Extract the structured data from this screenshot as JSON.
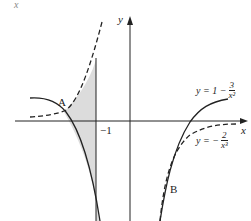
{
  "figure": {
    "corner_label": "x",
    "axes": {
      "x_label": "x",
      "y_label": "y",
      "tick_label": "−1"
    },
    "points": {
      "A": "A",
      "B": "B"
    },
    "curves": [
      {
        "id": "solid",
        "style": "solid",
        "lhs": "y = 1 −",
        "numerator": "3",
        "denominator": "x²",
        "formula": "y = 1 − 3/x²"
      },
      {
        "id": "dashed",
        "style": "dashed",
        "lhs": "y = −",
        "numerator": "2",
        "denominator": "x³",
        "formula": "y = −2/x³"
      }
    ],
    "shaded_region": "between the curves from A to x = −1",
    "colors": {
      "ink": "#222222",
      "shade": "#dcdcdc",
      "background": "#ffffff"
    }
  }
}
